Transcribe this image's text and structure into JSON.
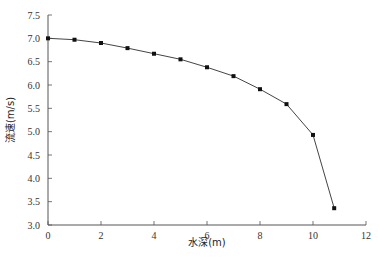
{
  "chart_data": {
    "type": "line",
    "title": "",
    "xlabel": "水深(m)",
    "ylabel": "流速(m/s)",
    "xlim": [
      0,
      12
    ],
    "ylim": [
      3.0,
      7.5
    ],
    "x_ticks": [
      "0",
      "2",
      "4",
      "6",
      "8",
      "10",
      "12"
    ],
    "y_ticks": [
      "3.0",
      "3.5",
      "4.0",
      "4.5",
      "5.0",
      "5.5",
      "6.0",
      "6.5",
      "7.0",
      "7.5"
    ],
    "grid": false,
    "legend": null,
    "series": [
      {
        "name": "流速",
        "marker": "square",
        "color": "#111111",
        "x": [
          0,
          1,
          2,
          3,
          4,
          5,
          6,
          7,
          8,
          9,
          10,
          10.8
        ],
        "y": [
          7.0,
          6.97,
          6.9,
          6.79,
          6.67,
          6.55,
          6.38,
          6.19,
          5.91,
          5.59,
          4.93,
          3.36
        ]
      }
    ]
  },
  "axes": {
    "x_title": "水深(m)",
    "y_title": "流速(m/s)"
  }
}
